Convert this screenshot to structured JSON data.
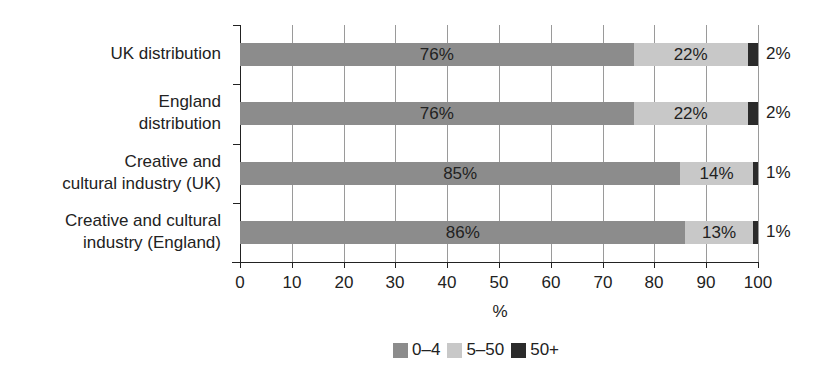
{
  "chart_data": {
    "type": "bar",
    "orientation": "horizontal",
    "stacked": true,
    "categories": [
      "UK distribution",
      "England distribution",
      "Creative and cultural industry (UK)",
      "Creative and cultural industry (England)"
    ],
    "category_lines": [
      [
        "UK distribution"
      ],
      [
        "England",
        "distribution"
      ],
      [
        "Creative and",
        "cultural industry (UK)"
      ],
      [
        "Creative and cultural",
        "industry (England)"
      ]
    ],
    "series": [
      {
        "name": "0–4",
        "color": "#8c8c8c",
        "values": [
          76,
          76,
          85,
          86
        ]
      },
      {
        "name": "5–50",
        "color": "#c8c8c8",
        "values": [
          22,
          22,
          14,
          13
        ]
      },
      {
        "name": "50+",
        "color": "#2b2b2b",
        "values": [
          2,
          2,
          1,
          1
        ]
      }
    ],
    "labels": [
      [
        "76%",
        "22%",
        "2%"
      ],
      [
        "76%",
        "22%",
        "2%"
      ],
      [
        "85%",
        "14%",
        "1%"
      ],
      [
        "86%",
        "13%",
        "1%"
      ]
    ],
    "xlabel": "%",
    "ylabel": "",
    "xlim": [
      0,
      100
    ],
    "xticks": [
      "0",
      "10",
      "20",
      "30",
      "40",
      "50",
      "60",
      "70",
      "80",
      "90",
      "100"
    ],
    "grid": true,
    "legend_position": "bottom"
  }
}
